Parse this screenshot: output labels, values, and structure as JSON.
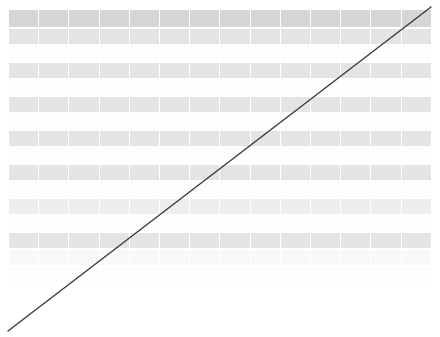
{
  "view": {
    "name": "zoomed-out-spreadsheet",
    "background_color": "#ffffff",
    "width": 440,
    "height": 337
  },
  "table": {
    "column_count": 14,
    "row_count": 16,
    "cell_text_legible": "no",
    "columns": [
      {
        "id": "c1",
        "header": ""
      },
      {
        "id": "c2",
        "header": ""
      },
      {
        "id": "c3",
        "header": ""
      },
      {
        "id": "c4",
        "header": ""
      },
      {
        "id": "c5",
        "header": ""
      },
      {
        "id": "c6",
        "header": ""
      },
      {
        "id": "c7",
        "header": ""
      },
      {
        "id": "c8",
        "header": ""
      },
      {
        "id": "c9",
        "header": ""
      },
      {
        "id": "c10",
        "header": ""
      },
      {
        "id": "c11",
        "header": ""
      },
      {
        "id": "c12",
        "header": ""
      },
      {
        "id": "c13",
        "header": ""
      },
      {
        "id": "c14",
        "header": ""
      }
    ],
    "row_styles": [
      "r-head",
      "r-med",
      "r-white",
      "r-med",
      "r-white",
      "r-med",
      "r-white",
      "r-med",
      "r-white",
      "r-med",
      "r-white",
      "r-lite",
      "r-white",
      "r-med",
      "r-pale",
      "r-white"
    ],
    "colors": {
      "header_band": "#d6d6d6",
      "medium_band": "#e4e4e4",
      "light_band": "#ededed",
      "pale_band": "#f8f8f8",
      "white_band": "#fdfdfd",
      "cell_gap": "#ffffff"
    }
  },
  "annotation": {
    "type": "line",
    "label": "diagonal-line",
    "color": "#3a3a3a",
    "stroke_width": 1.4,
    "x1": 8,
    "y1": 331,
    "x2": 431,
    "y2": 7
  }
}
